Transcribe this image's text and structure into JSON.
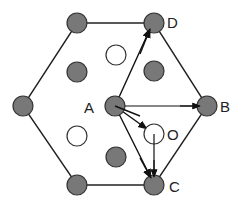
{
  "diagram": {
    "type": "hexagonal lattice with vector arrows",
    "colors": {
      "filled_atom": "#787878",
      "open_atom": "#ffffff",
      "stroke": "#222222",
      "background": "#ffffff"
    },
    "labels": {
      "A": "A",
      "B": "B",
      "C": "C",
      "D": "D",
      "O": "O"
    },
    "hexagon_vertices": [
      {
        "id": "top-left",
        "x": 77,
        "y": 23
      },
      {
        "id": "D",
        "x": 154,
        "y": 23
      },
      {
        "id": "B",
        "x": 207,
        "y": 106
      },
      {
        "id": "C",
        "x": 154,
        "y": 185
      },
      {
        "id": "bottom-left",
        "x": 77,
        "y": 185
      },
      {
        "id": "left",
        "x": 23,
        "y": 106
      }
    ],
    "filled_atoms": [
      {
        "id": "top-left",
        "x": 77,
        "y": 23
      },
      {
        "id": "D",
        "x": 154,
        "y": 23
      },
      {
        "id": "left",
        "x": 23,
        "y": 106
      },
      {
        "id": "A",
        "x": 115,
        "y": 106
      },
      {
        "id": "B",
        "x": 207,
        "y": 106
      },
      {
        "id": "bottom-left",
        "x": 77,
        "y": 185
      },
      {
        "id": "C",
        "x": 154,
        "y": 185
      },
      {
        "id": "inner-upper-left",
        "x": 77,
        "y": 72
      },
      {
        "id": "inner-upper-right",
        "x": 154,
        "y": 71
      },
      {
        "id": "inner-lower-center",
        "x": 116,
        "y": 157
      }
    ],
    "open_atoms": [
      {
        "id": "upper-center",
        "x": 116,
        "y": 55
      },
      {
        "id": "lower-left",
        "x": 77,
        "y": 136
      },
      {
        "id": "O",
        "x": 154,
        "y": 134
      }
    ],
    "arrows": [
      {
        "from": "A",
        "to": "D"
      },
      {
        "from": "A",
        "to": "B"
      },
      {
        "from": "A",
        "to": "C"
      },
      {
        "from": "A",
        "to": "O"
      },
      {
        "from": "O",
        "to": "C"
      }
    ]
  }
}
